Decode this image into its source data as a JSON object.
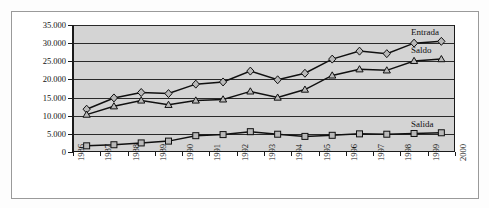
{
  "chart_data": {
    "type": "line",
    "title": "",
    "subtitle": "",
    "xlabel": "",
    "ylabel": "",
    "grid": true,
    "legend_position": "inline-right",
    "xlim": [
      1986,
      2000
    ],
    "ylim": [
      0,
      35000
    ],
    "y_ticks": [
      0,
      5000,
      10000,
      15000,
      20000,
      25000,
      30000,
      35000
    ],
    "y_tick_labels": [
      "0",
      "5.000",
      "10.000",
      "15.000",
      "20.000",
      "25.000",
      "30.000",
      "35.000"
    ],
    "x_ticks": [
      1986,
      1987,
      1988,
      1989,
      1990,
      1991,
      1992,
      1993,
      1994,
      1995,
      1996,
      1997,
      1998,
      1999,
      2000
    ],
    "x_tick_labels": [
      "1986",
      "1987",
      "1988",
      "1989",
      "1990",
      "1991",
      "1992",
      "1993",
      "1994",
      "1995",
      "1996",
      "1997",
      "1998",
      "1999",
      "2000"
    ],
    "x": [
      1986.5,
      1987.5,
      1988.5,
      1989.5,
      1990.5,
      1991.5,
      1992.5,
      1993.5,
      1994.5,
      1995.5,
      1996.5,
      1997.5,
      1998.5,
      1999.5
    ],
    "categories": [
      "1986",
      "1987",
      "1988",
      "1989",
      "1990",
      "1991",
      "1992",
      "1993",
      "1994",
      "1995",
      "1996",
      "1997",
      "1998",
      "1999"
    ],
    "series": [
      {
        "name": "Entrada",
        "marker": "diamond",
        "values": [
          11800,
          14900,
          16400,
          16100,
          18700,
          19300,
          22300,
          19900,
          21700,
          25600,
          27800,
          27100,
          30000,
          30500
        ]
      },
      {
        "name": "Saldo",
        "marker": "triangle",
        "values": [
          10300,
          12600,
          14200,
          13000,
          14200,
          14500,
          16700,
          15000,
          17200,
          21100,
          22800,
          22500,
          25100,
          25600
        ]
      },
      {
        "name": "Salida",
        "marker": "square",
        "values": [
          1700,
          2000,
          2500,
          3000,
          4500,
          4800,
          5600,
          4900,
          4300,
          4600,
          5000,
          4900,
          5100,
          5300
        ]
      }
    ],
    "annotations": [
      {
        "text": "Entrada",
        "series": "Entrada"
      },
      {
        "text": "Saldo",
        "series": "Saldo"
      },
      {
        "text": "Salida",
        "series": "Salida"
      }
    ],
    "colors": {
      "plot_background": "#d4d4d4",
      "axis": "#1a1a1a",
      "gridline": "#2a2a2a",
      "line": "#101010",
      "marker_fill": "#b9b9b9",
      "page_background": "#ffffff"
    }
  }
}
